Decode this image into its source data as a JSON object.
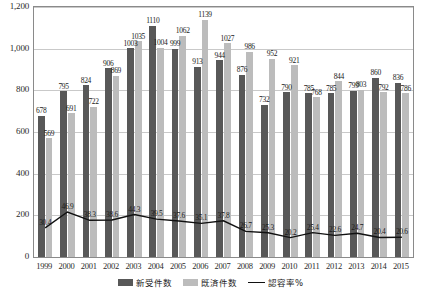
{
  "chart_data": {
    "type": "bar",
    "title": "",
    "xlabel": "",
    "ylabel": "",
    "ylim": [
      0,
      1200
    ],
    "yticks": [
      "0",
      "200",
      "400",
      "600",
      "800",
      "1,000",
      "1,200"
    ],
    "grid": true,
    "legend_position": "bottom",
    "categories": [
      "1999",
      "2000",
      "2001",
      "2002",
      "2003",
      "2004",
      "2005",
      "2006",
      "2007",
      "2008",
      "2009",
      "2010",
      "2011",
      "2012",
      "2013",
      "2014",
      "2015"
    ],
    "series": [
      {
        "name": "新受件数",
        "type": "bar",
        "color": "#585858",
        "values": [
          678,
          795,
          824,
          906,
          1003,
          1110,
          999,
          913,
          944,
          876,
          732,
          790,
          785,
          785,
          799,
          860,
          836
        ]
      },
      {
        "name": "既済件数",
        "type": "bar",
        "color": "#bcbcbc",
        "values": [
          569,
          691,
          722,
          869,
          1035,
          1004,
          1062,
          1139,
          1027,
          986,
          952,
          921,
          768,
          844,
          803,
          792,
          786
        ]
      },
      {
        "name": "認容率%",
        "type": "line",
        "color": "#111111",
        "axis": "secondary",
        "values": [
          30.4,
          46.9,
          38.3,
          38.6,
          44.3,
          39.5,
          37.6,
          35.1,
          37.8,
          26.7,
          25.3,
          20.2,
          25.4,
          22.6,
          24.7,
          20.4,
          20.6
        ]
      }
    ]
  },
  "legend": {
    "items": [
      {
        "label": "新受件数",
        "style": "dark"
      },
      {
        "label": "既済件数",
        "style": "light"
      },
      {
        "label": "認容率%",
        "style": "line"
      }
    ]
  }
}
